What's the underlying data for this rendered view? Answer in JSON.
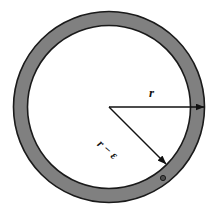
{
  "figure": {
    "type": "geometric-diagram",
    "background_color": "#ffffff",
    "ring": {
      "fill_color": "#808080",
      "stroke_color": "#1a1a1a",
      "interior_fill": "#ffffff",
      "center": {
        "x": 109,
        "y": 107
      },
      "outer_radius": 96,
      "inner_radius": 82,
      "band_thickness": 14
    },
    "marker_dot": {
      "name": "point-marker",
      "x": 163,
      "y": 178,
      "radius": 2.6,
      "fill_color": "#4d4d4d",
      "stroke_color": "#1a1a1a"
    },
    "arrows": [
      {
        "id": "radius-outer",
        "label": "r",
        "from": {
          "x": 109,
          "y": 107
        },
        "to": {
          "x": 205,
          "y": 107
        },
        "label_position": {
          "x": 149,
          "y": 86
        },
        "rotation_deg": 0,
        "stroke_color": "#111111",
        "target": "outer-circle"
      },
      {
        "id": "radius-inner",
        "label": "r − ε",
        "from": {
          "x": 109,
          "y": 107
        },
        "to": {
          "x": 167,
          "y": 165
        },
        "label_position": {
          "x": 99,
          "y": 136
        },
        "rotation_deg": 41,
        "stroke_color": "#111111",
        "target": "inner-circle"
      }
    ],
    "labels": {
      "outer_radius_label": "r",
      "inner_radius_label": "r − ε"
    }
  }
}
